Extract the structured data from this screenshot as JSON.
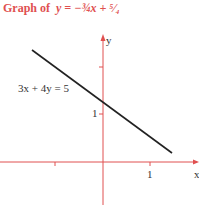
{
  "title": {
    "prefix": "Graph of",
    "equation": "y = −¾x + ⁵⁄₄"
  },
  "equation_label": "3x + 4y = 5",
  "axes": {
    "x_label": "x",
    "y_label": "y",
    "color": "#e05050"
  },
  "ticks": {
    "x_one": "1",
    "y_one": "1"
  },
  "line": {
    "color": "#222222",
    "from": [
      -1.5,
      2.375
    ],
    "to": [
      1.45,
      0.1875
    ]
  }
}
